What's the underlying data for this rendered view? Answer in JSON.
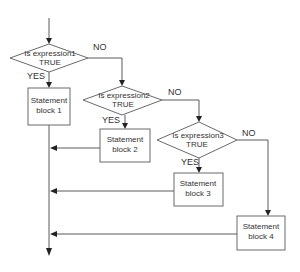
{
  "diagram": {
    "type": "flowchart",
    "decisions": [
      {
        "id": "d1",
        "line1": "Is expression1",
        "line2": "TRUE",
        "yes_label": "YES",
        "no_label": "NO"
      },
      {
        "id": "d2",
        "line1": "Is expression2",
        "line2": "TRUE",
        "yes_label": "YES",
        "no_label": "NO"
      },
      {
        "id": "d3",
        "line1": "Is expression3",
        "line2": "TRUE",
        "yes_label": "YES",
        "no_label": "NO"
      }
    ],
    "statements": [
      {
        "id": "s1",
        "line1": "Statement",
        "line2": "block 1"
      },
      {
        "id": "s2",
        "line1": "Statement",
        "line2": "block 2"
      },
      {
        "id": "s3",
        "line1": "Statement",
        "line2": "block 3"
      },
      {
        "id": "s4",
        "line1": "Statement",
        "line2": "block 4"
      }
    ],
    "edges": [
      {
        "from": "start",
        "to": "d1"
      },
      {
        "from": "d1",
        "to": "s1",
        "label": "YES"
      },
      {
        "from": "d1",
        "to": "d2",
        "label": "NO"
      },
      {
        "from": "d2",
        "to": "s2",
        "label": "YES"
      },
      {
        "from": "d2",
        "to": "d3",
        "label": "NO"
      },
      {
        "from": "d3",
        "to": "s3",
        "label": "YES"
      },
      {
        "from": "d3",
        "to": "s4",
        "label": "NO"
      },
      {
        "from": "s1",
        "to": "end"
      },
      {
        "from": "s2",
        "to": "end"
      },
      {
        "from": "s3",
        "to": "end"
      },
      {
        "from": "s4",
        "to": "end"
      }
    ]
  }
}
